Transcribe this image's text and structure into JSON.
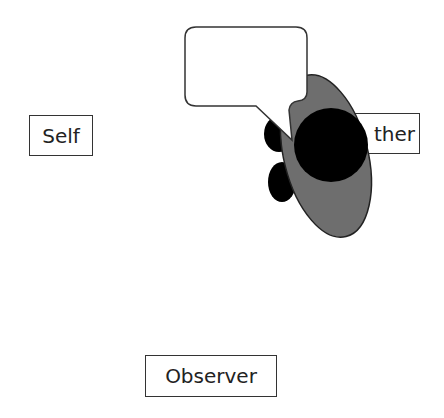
{
  "labels": {
    "self": "Self",
    "other": "Other",
    "other_visible": "ther",
    "observer": "Observer"
  },
  "speech_bubble": {
    "text": ""
  },
  "colors": {
    "figure_body": "#6e6e6e",
    "figure_head": "#000000",
    "outline": "#333333",
    "bubble_fill": "#ffffff"
  }
}
